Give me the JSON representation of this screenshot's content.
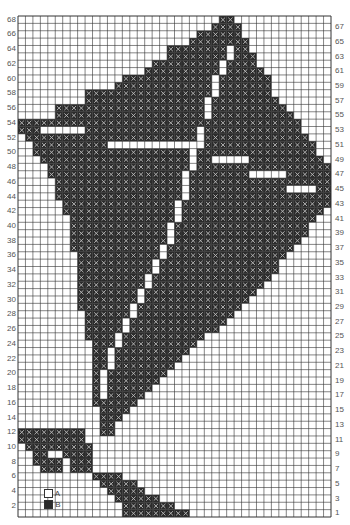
{
  "chart_data": {
    "type": "heatmap",
    "title": "",
    "grid": {
      "columns": 42,
      "rows": 68,
      "origin": "bottom-left, row 1 at bottom"
    },
    "left_row_labels": [
      2,
      4,
      6,
      8,
      10,
      12,
      14,
      16,
      18,
      20,
      22,
      24,
      26,
      28,
      30,
      32,
      34,
      36,
      38,
      40,
      42,
      44,
      46,
      48,
      50,
      52,
      54,
      56,
      58,
      60,
      62,
      64,
      66,
      68
    ],
    "right_row_labels": [
      1,
      3,
      5,
      7,
      9,
      11,
      13,
      15,
      17,
      19,
      21,
      23,
      25,
      27,
      29,
      31,
      33,
      35,
      37,
      39,
      41,
      43,
      45,
      47,
      49,
      51,
      53,
      55,
      57,
      59,
      61,
      63,
      65,
      67
    ],
    "legend": [
      {
        "symbol": "A",
        "label": "A",
        "style": "blank square",
        "color": "#ffffff"
      },
      {
        "symbol": "B",
        "label": "B",
        "style": "crossed dark square",
        "color": "#3a3a3a"
      }
    ],
    "colors": {
      "grid_line": "#333333",
      "fill_B": "#2b2b2b",
      "cross_B": "#bdbdbd",
      "background_A": "#ffffff"
    },
    "filled_runs_B": {
      "68": [
        [
          27,
          28
        ]
      ],
      "67": [
        [
          26,
          29
        ]
      ],
      "66": [
        [
          24,
          29
        ]
      ],
      "65": [
        [
          23,
          30
        ]
      ],
      "64": [
        [
          20,
          30
        ]
      ],
      "63": [
        [
          20,
          31
        ]
      ],
      "62": [
        [
          18,
          31
        ]
      ],
      "61": [
        [
          17,
          32
        ]
      ],
      "60": [
        [
          14,
          33
        ]
      ],
      "59": [
        [
          13,
          33
        ]
      ],
      "58": [
        [
          9,
          33
        ]
      ],
      "57": [
        [
          9,
          34
        ]
      ],
      "56": [
        [
          5,
          35
        ]
      ],
      "55": [
        [
          5,
          36
        ]
      ],
      "54": [
        [
          0,
          37
        ]
      ],
      "53": [
        [
          0,
          37
        ]
      ],
      "52": [
        [
          1,
          38
        ]
      ],
      "51": [
        [
          2,
          39
        ]
      ],
      "50": [
        [
          2,
          39
        ]
      ],
      "49": [
        [
          3,
          40
        ]
      ],
      "48": [
        [
          4,
          41
        ]
      ],
      "47": [
        [
          4,
          41
        ]
      ],
      "46": [
        [
          5,
          41
        ]
      ],
      "45": [
        [
          5,
          41
        ]
      ],
      "44": [
        [
          5,
          41
        ]
      ],
      "43": [
        [
          6,
          41
        ]
      ],
      "42": [
        [
          6,
          40
        ]
      ],
      "41": [
        [
          7,
          39
        ]
      ],
      "40": [
        [
          7,
          38
        ]
      ],
      "39": [
        [
          7,
          38
        ]
      ],
      "38": [
        [
          7,
          37
        ]
      ],
      "37": [
        [
          7,
          36
        ]
      ],
      "36": [
        [
          8,
          35
        ]
      ],
      "35": [
        [
          8,
          34
        ]
      ],
      "34": [
        [
          8,
          34
        ]
      ],
      "33": [
        [
          8,
          33
        ]
      ],
      "32": [
        [
          8,
          32
        ]
      ],
      "31": [
        [
          8,
          31
        ]
      ],
      "30": [
        [
          8,
          30
        ]
      ],
      "29": [
        [
          8,
          29
        ]
      ],
      "28": [
        [
          9,
          28
        ]
      ],
      "27": [
        [
          9,
          27
        ]
      ],
      "26": [
        [
          9,
          26
        ]
      ],
      "25": [
        [
          9,
          24
        ]
      ],
      "24": [
        [
          10,
          23
        ]
      ],
      "23": [
        [
          10,
          22
        ]
      ],
      "22": [
        [
          10,
          21
        ]
      ],
      "21": [
        [
          10,
          20
        ]
      ],
      "20": [
        [
          10,
          19
        ]
      ],
      "19": [
        [
          10,
          18
        ]
      ],
      "18": [
        [
          10,
          17
        ]
      ],
      "17": [
        [
          10,
          16
        ]
      ],
      "16": [
        [
          10,
          15
        ]
      ],
      "15": [
        [
          11,
          14
        ]
      ],
      "14": [
        [
          11,
          13
        ]
      ],
      "13": [
        [
          11,
          12
        ]
      ],
      "12": [
        [
          0,
          8
        ],
        [
          11,
          12
        ]
      ],
      "11": [
        [
          0,
          8
        ]
      ],
      "10": [
        [
          1,
          9
        ]
      ],
      "9": [
        [
          2,
          3
        ],
        [
          6,
          9
        ]
      ],
      "8": [
        [
          2,
          5
        ],
        [
          7,
          9
        ]
      ],
      "7": [
        [
          3,
          5
        ],
        [
          7,
          9
        ]
      ],
      "6": [
        [
          10,
          13
        ]
      ],
      "5": [
        [
          11,
          15
        ]
      ],
      "4": [
        [
          12,
          16
        ]
      ],
      "3": [
        [
          13,
          18
        ]
      ],
      "2": [
        [
          14,
          20
        ]
      ],
      "1": [
        [
          14,
          22
        ]
      ]
    },
    "white_A_cells": {
      "64": [
        [
          28,
          28
        ]
      ],
      "63": [
        [
          28,
          28
        ]
      ],
      "62": [
        [
          27,
          27
        ]
      ],
      "61": [
        [
          27,
          27
        ]
      ],
      "60": [
        [
          26,
          26
        ]
      ],
      "59": [
        [
          26,
          26
        ]
      ],
      "58": [
        [
          26,
          26
        ]
      ],
      "57": [
        [
          25,
          25
        ]
      ],
      "56": [
        [
          25,
          25
        ]
      ],
      "55": [
        [
          25,
          25
        ]
      ],
      "53": [
        [
          3,
          8
        ],
        [
          24,
          24
        ]
      ],
      "52": [
        [
          24,
          24
        ]
      ],
      "51": [
        [
          12,
          23
        ],
        [
          24,
          24
        ]
      ],
      "50": [
        [
          23,
          23
        ]
      ],
      "49": [
        [
          23,
          23
        ],
        [
          26,
          30
        ]
      ],
      "48": [
        [
          23,
          23
        ]
      ],
      "47": [
        [
          22,
          22
        ],
        [
          31,
          35
        ]
      ],
      "46": [
        [
          22,
          22
        ]
      ],
      "45": [
        [
          22,
          22
        ],
        [
          36,
          39
        ]
      ],
      "44": [
        [
          22,
          22
        ]
      ],
      "43": [
        [
          21,
          21
        ]
      ],
      "42": [
        [
          21,
          21
        ]
      ],
      "41": [
        [
          21,
          21
        ]
      ],
      "40": [
        [
          20,
          20
        ]
      ],
      "39": [
        [
          20,
          20
        ]
      ],
      "38": [
        [
          20,
          20
        ]
      ],
      "37": [
        [
          19,
          19
        ]
      ],
      "36": [
        [
          19,
          19
        ]
      ],
      "35": [
        [
          18,
          18
        ]
      ],
      "34": [
        [
          18,
          18
        ]
      ],
      "33": [
        [
          17,
          17
        ]
      ],
      "32": [
        [
          17,
          17
        ]
      ],
      "31": [
        [
          16,
          16
        ]
      ],
      "30": [
        [
          16,
          16
        ]
      ],
      "29": [
        [
          15,
          15
        ]
      ],
      "28": [
        [
          15,
          15
        ]
      ],
      "27": [
        [
          14,
          14
        ]
      ],
      "26": [
        [
          14,
          14
        ]
      ],
      "25": [
        [
          13,
          13
        ]
      ],
      "24": [
        [
          13,
          13
        ]
      ],
      "23": [
        [
          12,
          12
        ]
      ],
      "22": [
        [
          12,
          12
        ]
      ],
      "21": [
        [
          12,
          12
        ]
      ],
      "20": [
        [
          11,
          11
        ]
      ],
      "19": [
        [
          11,
          11
        ]
      ],
      "18": [
        [
          11,
          11
        ]
      ],
      "17": [
        [
          11,
          11
        ]
      ]
    }
  },
  "legend_labels": {
    "a": "A",
    "b": "B"
  }
}
